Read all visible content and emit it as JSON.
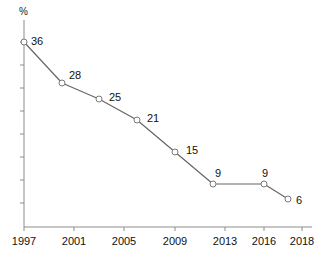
{
  "chart_data": {
    "type": "line",
    "title": "",
    "xlabel": "",
    "ylabel": "%",
    "ylim": [
      0,
      40
    ],
    "xlim": [
      1997,
      2018
    ],
    "grid": false,
    "legend": null,
    "categories": [
      "1997",
      "2000",
      "2003",
      "2006",
      "2009",
      "2012",
      "2016",
      "2017"
    ],
    "x": [
      1997,
      2000,
      2003,
      2006,
      2009,
      2012,
      2016,
      2017
    ],
    "values": [
      36,
      28,
      25,
      21,
      15,
      9,
      9,
      6
    ],
    "point_labels": [
      "36",
      "28",
      "25",
      "21",
      "15",
      "9",
      "9",
      "6"
    ],
    "xtick_labels": [
      "1997",
      "2001",
      "2005",
      "2009",
      "2013",
      "2016",
      "2018"
    ],
    "xtick_values": [
      1997,
      2001,
      2005,
      2009,
      2013,
      2016,
      2018
    ],
    "ytick_labels": [],
    "ytick_count": 8,
    "colors": {
      "line": "#666666",
      "marker_stroke": "#7a7a7a",
      "marker_fill": "#ffffff",
      "axis": "#8c8c8c",
      "text": "#111111",
      "background": "#ffffff"
    }
  },
  "axis": {
    "unit_label": "%"
  },
  "geometry": {
    "points": [
      {
        "cx": 24,
        "cy": 42,
        "label": "36",
        "lx": 31,
        "ly": 36
      },
      {
        "cx": 62,
        "cy": 83,
        "label": "28",
        "lx": 69,
        "ly": 70
      },
      {
        "cx": 99,
        "cy": 99,
        "label": "25",
        "lx": 109,
        "ly": 92
      },
      {
        "cx": 137,
        "cy": 120,
        "label": "21",
        "lx": 147,
        "ly": 113
      },
      {
        "cx": 175,
        "cy": 152,
        "label": "15",
        "lx": 186,
        "ly": 145
      },
      {
        "cx": 213,
        "cy": 184,
        "label": "9",
        "lx": 215,
        "ly": 168
      },
      {
        "cx": 264,
        "cy": 184,
        "label": "9",
        "lx": 262,
        "ly": 168
      },
      {
        "cx": 288,
        "cy": 199,
        "label": "6",
        "lx": 296,
        "ly": 195
      }
    ],
    "xticks": [
      {
        "x": 24,
        "label": "1997"
      },
      {
        "x": 74,
        "label": "2001"
      },
      {
        "x": 124,
        "label": "2005"
      },
      {
        "x": 175,
        "label": "2009"
      },
      {
        "x": 225,
        "label": "2013"
      },
      {
        "x": 264,
        "label": "2016"
      },
      {
        "x": 302,
        "label": "2018"
      }
    ],
    "yticks": [
      42,
      65,
      88,
      111,
      134,
      157,
      180,
      203
    ],
    "axis_x_start": 24,
    "axis_x_end": 312,
    "axis_y_baseline": 227,
    "axis_y_top": 20
  }
}
